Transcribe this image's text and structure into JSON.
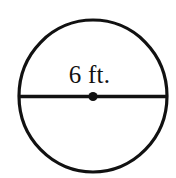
{
  "figure": {
    "kind": "geometry-diagram",
    "shape_name": "circle",
    "background_color": "#ffffff",
    "stroke_color": "#111111",
    "label_color": "#111111",
    "diameter_label": "6 ft.",
    "measurement": {
      "value": "6",
      "unit": "ft.",
      "quantity": "diameter"
    },
    "elements": {
      "circle_outline_name": "circle-outline",
      "diameter_line_name": "diameter-line",
      "center_point_name": "center-point"
    },
    "geometry": {
      "center_x": 93,
      "center_y": 96,
      "radius_x": 74,
      "radius_y": 76,
      "stroke_width": 3.2,
      "center_dot_radius": 4.6,
      "diameter_left_x": 19,
      "diameter_right_x": 167
    }
  }
}
